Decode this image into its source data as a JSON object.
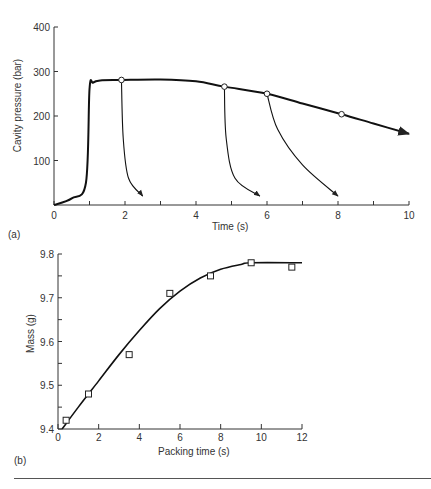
{
  "chart_data": [
    {
      "panel_label": "(a)",
      "type": "line",
      "title": "",
      "xlabel": "Time (s)",
      "ylabel": "Cavity pressure (bar)",
      "xlim": [
        0,
        10
      ],
      "ylim": [
        0,
        400
      ],
      "x_ticks": [
        0,
        2,
        4,
        6,
        8,
        10
      ],
      "y_ticks": [
        100,
        200,
        300,
        400
      ],
      "grid": false,
      "series": [
        {
          "name": "main pressure curve",
          "x": [
            0,
            0.5,
            0.9,
            1.0,
            1.1,
            1.3,
            1.9,
            3,
            4,
            4.8,
            6,
            7,
            8.1,
            9,
            10
          ],
          "values": [
            0,
            15,
            50,
            260,
            275,
            280,
            281,
            282,
            278,
            266,
            250,
            228,
            204,
            183,
            160
          ]
        },
        {
          "name": "gate freeze branch at 1.9 s",
          "x": [
            1.9,
            1.95,
            2.1,
            2.5
          ],
          "values": [
            281,
            150,
            60,
            20
          ]
        },
        {
          "name": "gate freeze branch at 4.8 s",
          "x": [
            4.8,
            4.85,
            5.1,
            5.8
          ],
          "values": [
            266,
            150,
            60,
            20
          ]
        },
        {
          "name": "gate freeze branch at 6 s",
          "x": [
            6.0,
            6.3,
            7.0,
            8.0
          ],
          "values": [
            250,
            170,
            90,
            20
          ]
        }
      ],
      "markers": [
        {
          "x": 1.9,
          "y": 281
        },
        {
          "x": 4.8,
          "y": 266
        },
        {
          "x": 6.0,
          "y": 250
        },
        {
          "x": 8.1,
          "y": 204
        }
      ]
    },
    {
      "panel_label": "(b)",
      "type": "scatter",
      "title": "",
      "xlabel": "Packing time (s)",
      "ylabel": "Mass (g)",
      "xlim": [
        0,
        12
      ],
      "ylim": [
        9.4,
        9.8
      ],
      "x_ticks": [
        0,
        2,
        4,
        6,
        8,
        10,
        12
      ],
      "y_ticks": [
        9.4,
        9.5,
        9.6,
        9.7,
        9.8
      ],
      "grid": false,
      "series": [
        {
          "name": "measured",
          "x": [
            0.4,
            1.5,
            3.5,
            5.5,
            7.5,
            9.5,
            11.5
          ],
          "values": [
            9.42,
            9.48,
            9.57,
            9.71,
            9.75,
            9.78,
            9.77
          ]
        },
        {
          "name": "fit curve",
          "x": [
            0.2,
            1,
            2,
            3,
            4,
            5,
            6,
            7,
            8,
            9,
            9.5,
            12
          ],
          "values": [
            9.4,
            9.45,
            9.51,
            9.57,
            9.625,
            9.675,
            9.715,
            9.745,
            9.765,
            9.776,
            9.78,
            9.78
          ]
        }
      ]
    }
  ]
}
